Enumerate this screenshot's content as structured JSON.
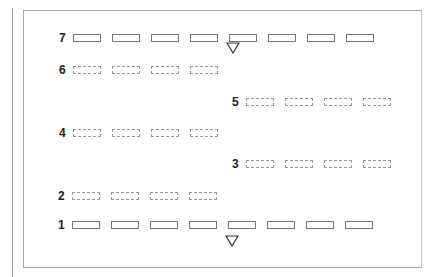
{
  "diagram": {
    "rows": [
      {
        "label": "7",
        "style": "solid",
        "left": 59,
        "top": 31,
        "count": 8
      },
      {
        "label": "6",
        "style": "dashed",
        "left": 59,
        "top": 63,
        "count": 4
      },
      {
        "label": "5",
        "style": "dashed",
        "left": 232,
        "top": 95,
        "count": 4
      },
      {
        "label": "4",
        "style": "dashed",
        "left": 59,
        "top": 126,
        "count": 4
      },
      {
        "label": "3",
        "style": "dashed",
        "left": 232,
        "top": 157,
        "count": 4
      },
      {
        "label": "2",
        "style": "dashed",
        "left": 58,
        "top": 189,
        "count": 4
      },
      {
        "label": "1",
        "style": "solid",
        "left": 58,
        "top": 218,
        "count": 8
      }
    ],
    "markers": [
      {
        "name": "top-triangle",
        "x": 226,
        "y": 42
      },
      {
        "name": "bottom-triangle",
        "x": 225,
        "y": 235
      }
    ]
  }
}
